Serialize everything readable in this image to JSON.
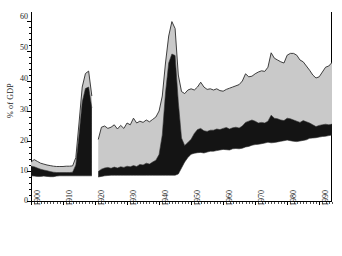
{
  "chart_data": {
    "type": "area",
    "title": "",
    "xlabel": "",
    "ylabel": "% of GDP",
    "xlim": [
      1900,
      1994
    ],
    "ylim": [
      0,
      63
    ],
    "yticks": [
      0,
      10,
      20,
      30,
      40,
      50,
      60
    ],
    "ytick_labels": [
      "0",
      "10",
      "20",
      "30",
      "40",
      "50",
      "60"
    ],
    "xticks": [
      1900,
      1910,
      1920,
      1930,
      1940,
      1950,
      1960,
      1970,
      1980,
      1990
    ],
    "xtick_labels": [
      "1900",
      "1910",
      "1920",
      "1930",
      "1940",
      "1950",
      "1960",
      "1970",
      "1980",
      "1990"
    ],
    "grid": false,
    "legend_position": "none",
    "colors": {
      "band_light": "#c9c9c9",
      "band_dark": "#141414",
      "outline": "#2b2b2b",
      "axis": "#000000",
      "background": "#ffffff"
    },
    "series": [
      {
        "name": "lower-boundary",
        "description": "bottom edge of dark band",
        "x": [
          1900,
          1901,
          1902,
          1903,
          1904,
          1905,
          1906,
          1907,
          1908,
          1909,
          1910,
          1911,
          1912,
          1913,
          1914,
          1915,
          1916,
          1917,
          1918,
          1919,
          1921,
          1922,
          1923,
          1924,
          1925,
          1926,
          1927,
          1928,
          1929,
          1930,
          1931,
          1932,
          1933,
          1934,
          1935,
          1936,
          1937,
          1938,
          1939,
          1940,
          1941,
          1942,
          1943,
          1944,
          1945,
          1946,
          1947,
          1948,
          1949,
          1950,
          1951,
          1952,
          1953,
          1954,
          1955,
          1956,
          1957,
          1958,
          1959,
          1960,
          1961,
          1962,
          1963,
          1964,
          1965,
          1966,
          1967,
          1968,
          1969,
          1970,
          1971,
          1972,
          1973,
          1974,
          1975,
          1976,
          1977,
          1978,
          1979,
          1980,
          1981,
          1982,
          1983,
          1984,
          1985,
          1986,
          1987,
          1988,
          1989,
          1990,
          1991,
          1992,
          1993,
          1994
        ],
        "values": [
          8.4,
          8.3,
          8.2,
          8.2,
          8.3,
          8.2,
          8.1,
          8.1,
          8.3,
          8.4,
          8.4,
          8.4,
          8.4,
          8.4,
          8.4,
          8.4,
          8.4,
          8.4,
          8.4,
          8.4,
          8.0,
          8.2,
          8.4,
          8.5,
          8.6,
          8.6,
          8.6,
          8.6,
          8.6,
          8.6,
          8.6,
          8.6,
          8.6,
          8.6,
          8.6,
          8.6,
          8.6,
          8.6,
          8.6,
          8.6,
          8.6,
          8.6,
          8.6,
          8.6,
          8.6,
          9.0,
          11.0,
          13.0,
          14.5,
          15.6,
          15.9,
          16.1,
          16.2,
          16.0,
          16.3,
          16.6,
          16.6,
          16.8,
          17.0,
          17.2,
          17.1,
          17.0,
          17.4,
          17.5,
          17.4,
          17.6,
          18.0,
          18.2,
          18.6,
          18.8,
          18.9,
          19.1,
          19.3,
          19.6,
          19.4,
          19.5,
          19.7,
          19.9,
          20.1,
          20.3,
          20.1,
          19.9,
          19.8,
          20.0,
          20.2,
          20.4,
          20.9,
          21.0,
          21.1,
          21.3,
          21.5,
          21.6,
          21.8,
          22.0
        ]
      },
      {
        "name": "dark-band-top",
        "description": "boundary between dark band and light-gray band",
        "x": [
          1900,
          1901,
          1902,
          1903,
          1904,
          1905,
          1906,
          1907,
          1908,
          1909,
          1910,
          1911,
          1912,
          1913,
          1914,
          1915,
          1916,
          1917,
          1918,
          1919,
          1921,
          1922,
          1923,
          1924,
          1925,
          1926,
          1927,
          1928,
          1929,
          1930,
          1931,
          1932,
          1933,
          1934,
          1935,
          1936,
          1937,
          1938,
          1939,
          1940,
          1941,
          1942,
          1943,
          1944,
          1945,
          1946,
          1947,
          1948,
          1949,
          1950,
          1951,
          1952,
          1953,
          1954,
          1955,
          1956,
          1957,
          1958,
          1959,
          1960,
          1961,
          1962,
          1963,
          1964,
          1965,
          1966,
          1967,
          1968,
          1969,
          1970,
          1971,
          1972,
          1973,
          1974,
          1975,
          1976,
          1977,
          1978,
          1979,
          1980,
          1981,
          1982,
          1983,
          1984,
          1985,
          1986,
          1987,
          1988,
          1989,
          1990,
          1991,
          1992,
          1993,
          1994
        ],
        "values": [
          11.6,
          11.4,
          11.0,
          10.6,
          10.3,
          10.1,
          9.8,
          9.6,
          9.5,
          9.5,
          9.5,
          9.5,
          9.5,
          9.6,
          12.0,
          22.0,
          33.0,
          37.5,
          38.0,
          31.0,
          9.8,
          10.6,
          11.0,
          11.2,
          10.9,
          11.3,
          11.0,
          11.4,
          11.2,
          11.6,
          11.4,
          11.8,
          11.5,
          12.2,
          12.0,
          12.6,
          12.3,
          13.0,
          13.6,
          15.5,
          22.0,
          36.0,
          46.0,
          49.0,
          48.5,
          33.0,
          21.0,
          18.5,
          19.5,
          20.6,
          22.5,
          23.8,
          24.2,
          23.4,
          23.2,
          23.6,
          23.6,
          24.0,
          23.8,
          24.2,
          24.5,
          24.0,
          24.4,
          24.6,
          24.3,
          25.0,
          26.2,
          26.6,
          27.0,
          26.6,
          26.0,
          26.2,
          26.0,
          26.6,
          28.6,
          27.6,
          27.4,
          27.0,
          26.8,
          27.6,
          27.4,
          27.0,
          26.6,
          26.2,
          26.8,
          26.4,
          26.0,
          25.4,
          24.8,
          25.2,
          25.4,
          25.6,
          25.4,
          25.6
        ]
      },
      {
        "name": "light-band-top",
        "description": "top edge of light-gray band (total)",
        "x": [
          1900,
          1901,
          1902,
          1903,
          1904,
          1905,
          1906,
          1907,
          1908,
          1909,
          1910,
          1911,
          1912,
          1913,
          1914,
          1915,
          1916,
          1917,
          1918,
          1919,
          1921,
          1922,
          1923,
          1924,
          1925,
          1926,
          1927,
          1928,
          1929,
          1930,
          1931,
          1932,
          1933,
          1934,
          1935,
          1936,
          1937,
          1938,
          1939,
          1940,
          1941,
          1942,
          1943,
          1944,
          1945,
          1946,
          1947,
          1948,
          1949,
          1950,
          1951,
          1952,
          1953,
          1954,
          1955,
          1956,
          1957,
          1958,
          1959,
          1960,
          1961,
          1962,
          1963,
          1964,
          1965,
          1966,
          1967,
          1968,
          1969,
          1970,
          1971,
          1972,
          1973,
          1974,
          1975,
          1976,
          1977,
          1978,
          1979,
          1980,
          1981,
          1982,
          1983,
          1984,
          1985,
          1986,
          1987,
          1988,
          1989,
          1990,
          1991,
          1992,
          1993,
          1994
        ],
        "values": [
          13.0,
          13.8,
          13.2,
          12.6,
          12.3,
          12.0,
          11.8,
          11.6,
          11.5,
          11.5,
          11.5,
          11.6,
          11.6,
          11.7,
          14.5,
          26.0,
          38.0,
          42.5,
          43.3,
          35.0,
          20.5,
          24.6,
          25.0,
          24.2,
          24.6,
          25.4,
          24.0,
          25.2,
          24.2,
          26.0,
          25.4,
          27.6,
          26.0,
          26.6,
          26.2,
          27.0,
          26.4,
          27.2,
          28.0,
          30.0,
          35.0,
          46.0,
          55.0,
          59.8,
          57.5,
          42.0,
          36.5,
          35.8,
          37.0,
          37.4,
          37.0,
          38.0,
          39.6,
          38.0,
          37.2,
          37.4,
          37.0,
          37.4,
          36.8,
          36.6,
          37.2,
          37.6,
          38.0,
          38.4,
          38.8,
          40.0,
          42.4,
          41.4,
          41.6,
          42.4,
          43.0,
          43.4,
          43.2,
          44.6,
          49.4,
          47.6,
          47.0,
          46.4,
          46.0,
          48.6,
          49.2,
          49.2,
          48.6,
          47.0,
          46.4,
          45.0,
          43.6,
          42.0,
          41.0,
          41.4,
          43.0,
          44.6,
          45.0,
          46.2
        ]
      }
    ],
    "annotations": [
      {
        "text": "data gap",
        "x_range": [
          1919,
          1921
        ]
      }
    ]
  },
  "caption": {
    "text": ""
  }
}
